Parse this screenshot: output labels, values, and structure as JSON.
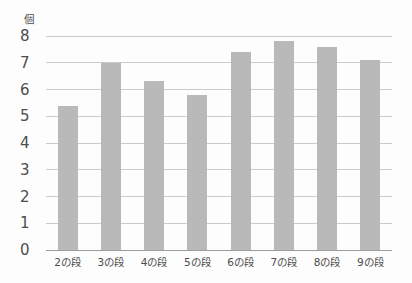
{
  "chart_data": {
    "type": "bar",
    "title": "",
    "unit_label": "個",
    "categories": [
      "2の段",
      "3の段",
      "4の段",
      "5の段",
      "6の段",
      "7の段",
      "8の段",
      "9の段"
    ],
    "values": [
      5.4,
      7.0,
      6.3,
      5.8,
      7.4,
      7.8,
      7.6,
      7.1
    ],
    "xlabel": "",
    "ylabel": "個",
    "ylim": [
      0,
      8
    ],
    "yticks": [
      0,
      1,
      2,
      3,
      4,
      5,
      6,
      7,
      8
    ],
    "grid": "horizontal",
    "legend": "none",
    "colors": {
      "bar": "#b9b9b9",
      "gridline": "#cbcbcb",
      "baseline": "#9c9c9c",
      "text": "#4d4d4d",
      "background": "#fdfdfd"
    }
  }
}
